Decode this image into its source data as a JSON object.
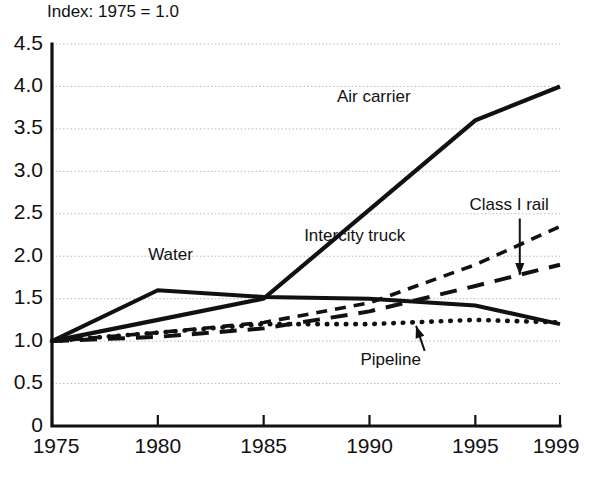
{
  "chart_data": {
    "type": "line",
    "title": "Index: 1975 = 1.0",
    "xlabel": "",
    "ylabel": "",
    "xlim": [
      1975,
      1999
    ],
    "ylim": [
      0,
      4.5
    ],
    "grid": true,
    "legend_position": "inline-annotations",
    "x_ticks": [
      "1975",
      "1980",
      "1985",
      "1990",
      "1995",
      "1999"
    ],
    "x_tick_values": [
      1975,
      1980,
      1985,
      1990,
      1995,
      1999
    ],
    "y_ticks": [
      "0",
      "0.5",
      "1.0",
      "1.5",
      "2.0",
      "2.5",
      "3.0",
      "3.5",
      "4.0",
      "4.5"
    ],
    "y_tick_values": [
      0,
      0.5,
      1.0,
      1.5,
      2.0,
      2.5,
      3.0,
      3.5,
      4.0,
      4.5
    ],
    "x": [
      1975,
      1980,
      1985,
      1990,
      1995,
      1999
    ],
    "series": [
      {
        "name": "Air carrier",
        "style": "solid",
        "values": [
          1.0,
          1.25,
          1.5,
          2.55,
          3.6,
          4.0
        ]
      },
      {
        "name": "Water",
        "style": "solid",
        "values": [
          1.0,
          1.6,
          1.52,
          1.5,
          1.42,
          1.2
        ]
      },
      {
        "name": "Intercity truck",
        "style": "short-dash",
        "values": [
          1.0,
          1.1,
          1.22,
          1.45,
          1.9,
          2.35
        ]
      },
      {
        "name": "Class I rail",
        "style": "long-dash",
        "values": [
          1.0,
          1.05,
          1.15,
          1.35,
          1.65,
          1.9
        ]
      },
      {
        "name": "Pipeline",
        "style": "dotted",
        "values": [
          1.0,
          1.1,
          1.2,
          1.2,
          1.25,
          1.22
        ]
      }
    ],
    "annotations": [
      {
        "text": "Air carrier",
        "x": 1990.2,
        "y": 3.82,
        "arrow": false
      },
      {
        "text": "Water",
        "x": 1980.6,
        "y": 1.95,
        "arrow": false
      },
      {
        "text": "Intercity truck",
        "x": 1989.3,
        "y": 2.18,
        "arrow": false
      },
      {
        "text": "Class I rail",
        "x": 1996.6,
        "y": 2.55,
        "arrow": true,
        "arrow_to_x": 1997.1,
        "arrow_to_y": 1.78
      },
      {
        "text": "Pipeline",
        "x": 1991.0,
        "y": 0.72,
        "arrow": true,
        "arrow_to_x": 1992.2,
        "arrow_to_y": 1.18
      }
    ]
  }
}
